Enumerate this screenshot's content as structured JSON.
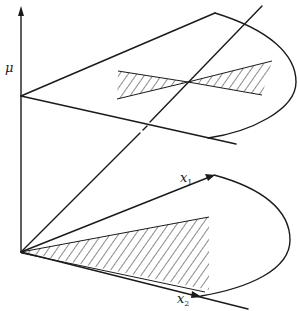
{
  "figure": {
    "colors": {
      "ink": "#1a1a1a",
      "background": "#ffffff"
    },
    "labels": {
      "mu_axis": "μ",
      "x1_axis": "x",
      "x1_sub": "1",
      "x2_axis": "x",
      "x2_sub": "2"
    },
    "points": {
      "origin": [
        21,
        252
      ],
      "mu_axis_top": [
        21,
        8
      ],
      "upper_cone_apex": [
        21,
        96
      ],
      "upper_cone_top_vertex": [
        215,
        13
      ],
      "upper_cone_bottom_end": [
        236,
        144
      ],
      "diagonal_end": [
        262,
        6
      ],
      "x1_tip": [
        214,
        175
      ],
      "x2_tip": [
        200,
        296
      ],
      "x2_line_end": [
        248,
        309
      ]
    }
  }
}
